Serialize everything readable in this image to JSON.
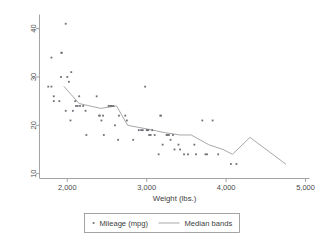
{
  "chart_data": {
    "type": "scatter",
    "title": "",
    "xlabel": "Weight (lbs.)",
    "ylabel": "",
    "xlim": [
      1650,
      5050
    ],
    "ylim": [
      9,
      42.5
    ],
    "xticks": [
      2000,
      3000,
      4000,
      5000
    ],
    "xtick_labels": [
      "2,000",
      "3,000",
      "4,000",
      "5,000"
    ],
    "yticks": [
      10,
      20,
      30,
      40
    ],
    "ytick_labels": [
      "10",
      "20",
      "30",
      "40"
    ],
    "grid": false,
    "legend_position": "bottom",
    "series": [
      {
        "name": "Mileage (mpg)",
        "type": "scatter",
        "marker": "point",
        "color": "#6f6f76",
        "points": [
          [
            1760,
            28
          ],
          [
            1800,
            28
          ],
          [
            1800,
            34
          ],
          [
            1830,
            26
          ],
          [
            1830,
            25
          ],
          [
            1900,
            25
          ],
          [
            1920,
            30
          ],
          [
            1925,
            35
          ],
          [
            1930,
            35
          ],
          [
            1980,
            41
          ],
          [
            1980,
            23
          ],
          [
            2000,
            30
          ],
          [
            2020,
            29
          ],
          [
            2040,
            21
          ],
          [
            2050,
            31
          ],
          [
            2070,
            23
          ],
          [
            2100,
            25
          ],
          [
            2110,
            24
          ],
          [
            2130,
            24
          ],
          [
            2150,
            26
          ],
          [
            2160,
            24
          ],
          [
            2200,
            24
          ],
          [
            2230,
            23
          ],
          [
            2240,
            18
          ],
          [
            2370,
            26
          ],
          [
            2400,
            22
          ],
          [
            2410,
            22
          ],
          [
            2430,
            21
          ],
          [
            2450,
            22
          ],
          [
            2460,
            18
          ],
          [
            2520,
            24
          ],
          [
            2540,
            24
          ],
          [
            2560,
            24
          ],
          [
            2580,
            24
          ],
          [
            2600,
            20
          ],
          [
            2640,
            17
          ],
          [
            2650,
            22
          ],
          [
            2730,
            22
          ],
          [
            2750,
            21
          ],
          [
            2830,
            17
          ],
          [
            2900,
            19
          ],
          [
            2930,
            19
          ],
          [
            2950,
            19
          ],
          [
            2980,
            28
          ],
          [
            3000,
            19
          ],
          [
            3010,
            19
          ],
          [
            3020,
            19
          ],
          [
            3030,
            18
          ],
          [
            3050,
            18
          ],
          [
            3070,
            19
          ],
          [
            3100,
            18
          ],
          [
            3150,
            14
          ],
          [
            3170,
            22
          ],
          [
            3180,
            22
          ],
          [
            3200,
            16
          ],
          [
            3250,
            18
          ],
          [
            3260,
            18
          ],
          [
            3280,
            18
          ],
          [
            3300,
            17
          ],
          [
            3330,
            18
          ],
          [
            3350,
            15
          ],
          [
            3400,
            16
          ],
          [
            3420,
            15
          ],
          [
            3470,
            14
          ],
          [
            3520,
            14
          ],
          [
            3600,
            16
          ],
          [
            3620,
            14
          ],
          [
            3700,
            21
          ],
          [
            3740,
            14
          ],
          [
            3760,
            14
          ],
          [
            3830,
            21
          ],
          [
            3900,
            14
          ],
          [
            4060,
            12
          ],
          [
            4130,
            12
          ]
        ]
      },
      {
        "name": "Median bands",
        "type": "line",
        "color": "#a8a8a8",
        "points": [
          [
            1960,
            28
          ],
          [
            2150,
            24.5
          ],
          [
            2420,
            23.5
          ],
          [
            2620,
            24
          ],
          [
            2760,
            20
          ],
          [
            3080,
            19
          ],
          [
            3220,
            18.5
          ],
          [
            3420,
            18
          ],
          [
            3560,
            18
          ],
          [
            3780,
            16
          ],
          [
            3960,
            15
          ],
          [
            4080,
            14
          ],
          [
            4300,
            17.5
          ],
          [
            4750,
            12
          ]
        ]
      }
    ],
    "legend": [
      {
        "label": "Mileage (mpg)",
        "marker": "point",
        "color": "#6f6f76"
      },
      {
        "label": "Median bands",
        "marker": "line",
        "color": "#a8a8a8"
      }
    ]
  }
}
